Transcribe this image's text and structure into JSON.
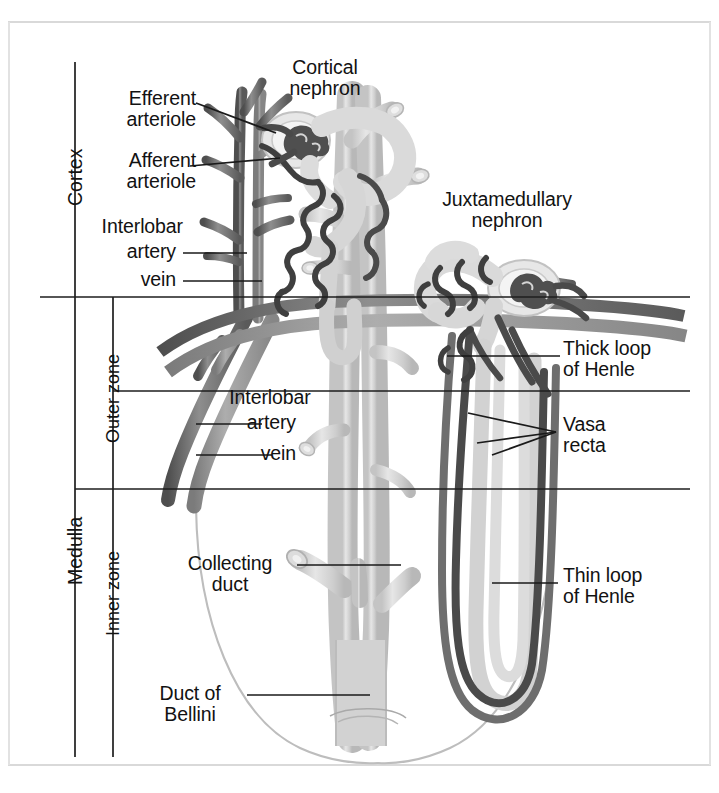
{
  "figure": {
    "frame_color": "#d8d8d8",
    "line_color": "#1a1a1a",
    "ink": {
      "artery_dark": "#5e5e5e",
      "vein_mid": "#8a8a8a",
      "capillary_dark": "#4a4a4a",
      "tubule_light": "#cfcfcf",
      "tubule_pale": "#e2e2e2",
      "outline_faint": "#b9b9b9"
    }
  },
  "axis": {
    "zones": [
      {
        "id": "cortex",
        "label": "Cortex"
      },
      {
        "id": "medulla",
        "label": "Medulla"
      },
      {
        "id": "outer-zone",
        "label": "Outer zone"
      },
      {
        "id": "inner-zone",
        "label": "Inner zone"
      }
    ]
  },
  "labels": {
    "efferent_arteriole": "Efferent\narteriole",
    "afferent_arteriole": "Afferent\narteriole",
    "interlobar_cortex": "Interlobar",
    "interlobar_cortex_artery": "artery",
    "interlobar_cortex_vein": "vein",
    "cortical_nephron": "Cortical\nnephron",
    "juxtamedullary_nephron": "Juxtamedullary\nnephron",
    "thick_loop": "Thick loop\nof Henle",
    "vasa_recta": "Vasa\nrecta",
    "interlobar_medulla": "Interlobar",
    "interlobar_medulla_artery": "artery",
    "interlobar_medulla_vein": "vein",
    "collecting_duct": "Collecting\nduct",
    "duct_of_bellini": "Duct of\nBellini",
    "thin_loop": "Thin loop\nof Henle"
  },
  "structures": [
    {
      "name": "glomerulus-cortical",
      "zone": "cortex"
    },
    {
      "name": "glomerulus-juxtamedullary",
      "zone": "cortex"
    },
    {
      "name": "arcuate-artery",
      "zone": "cortico-medullary-junction"
    },
    {
      "name": "arcuate-vein",
      "zone": "cortico-medullary-junction"
    },
    {
      "name": "collecting-duct-tree",
      "zone": "medulla"
    },
    {
      "name": "renal-papilla-outline",
      "zone": "inner-zone"
    }
  ]
}
